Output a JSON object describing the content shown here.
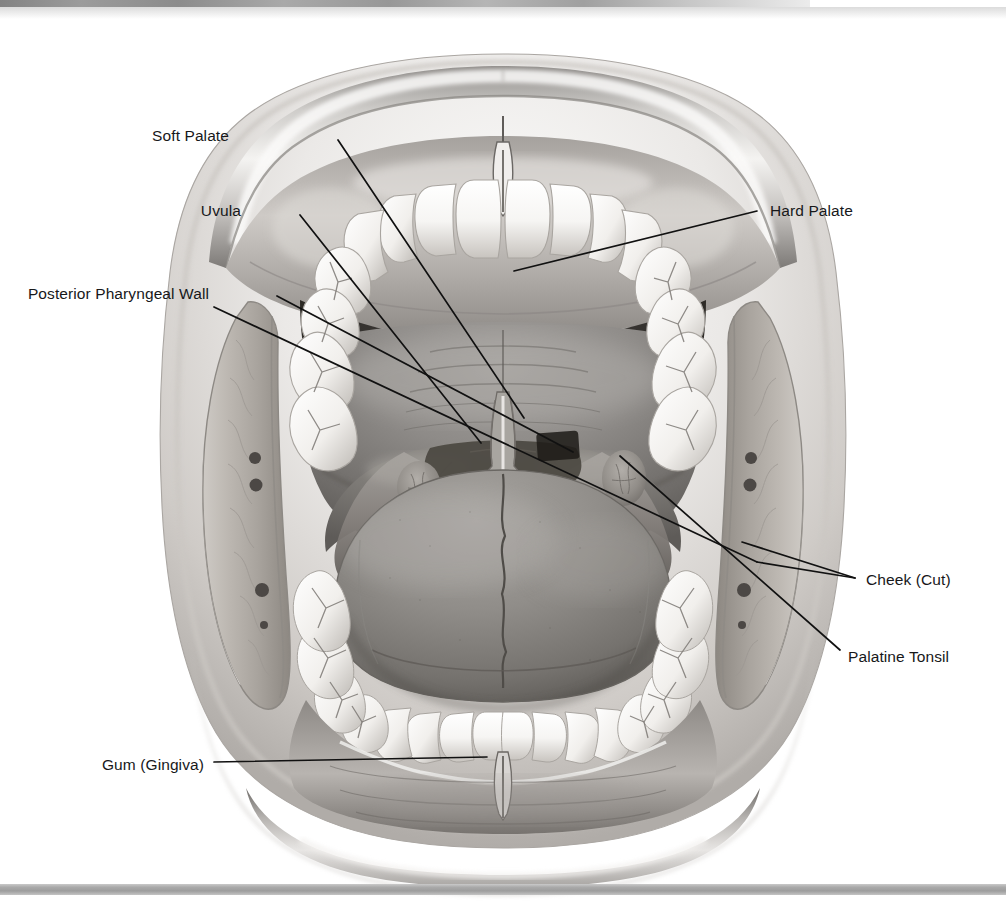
{
  "figure": {
    "style": "grayscale medical illustration, pen-and-ink with airbrush shading"
  },
  "colors": {
    "background": "#ffffff",
    "leader_line": "#111111",
    "label_text": "#17181a",
    "scan_edge_dark": "#6d6d6d",
    "bottom_bar": "#a9a9a9",
    "lip_light": "#f3f1ef",
    "lip_mid": "#b9b6b3",
    "lip_dark": "#6e6b68",
    "palate_mid": "#8d8a88",
    "palate_dark": "#56534f",
    "tooth_light": "#fbfbfa",
    "tooth_shadow": "#a9a6a2",
    "tongue_mid": "#8b8885",
    "tongue_dark": "#5d5a57",
    "pharynx_dark": "#2e2c2a",
    "cheek_tissue": "#b4b0ab",
    "cheek_vessel": "#4c4845"
  },
  "labels": [
    {
      "id": "soft-palate",
      "text": "Soft Palate",
      "align": "right",
      "text_x": 229,
      "text_y": 128,
      "leader": [
        [
          338,
          140
        ],
        [
          524,
          418
        ]
      ]
    },
    {
      "id": "uvula",
      "text": "Uvula",
      "align": "right",
      "text_x": 241,
      "text_y": 203,
      "leader": [
        [
          300,
          215
        ],
        [
          481,
          443
        ]
      ]
    },
    {
      "id": "posterior-pharyngeal-wall",
      "text": "Posterior Pharyngeal Wall",
      "align": "right",
      "text_x": 61,
      "text_y": 286,
      "leader": [
        [
          277,
          296
        ],
        [
          573,
          452
        ]
      ]
    },
    {
      "id": "hard-palate",
      "text": "Hard Palate",
      "align": "left",
      "text_x": 770,
      "text_y": 203,
      "leader": [
        [
          757,
          211
        ],
        [
          514,
          271
        ]
      ]
    },
    {
      "id": "cheek-cut",
      "text": "Cheek (Cut)",
      "align": "left",
      "text_x": 866,
      "text_y": 572,
      "leader": [
        [
          855,
          578
        ],
        [
          742,
          542
        ]
      ],
      "leader2": [
        [
          855,
          578
        ],
        [
          757,
          562
        ]
      ],
      "leader3": [
        [
          757,
          562
        ],
        [
          214,
          307
        ]
      ]
    },
    {
      "id": "palatine-tonsil",
      "text": "Palatine Tonsil",
      "align": "left",
      "text_x": 848,
      "text_y": 649,
      "leader": [
        [
          840,
          650
        ],
        [
          620,
          456
        ]
      ]
    },
    {
      "id": "gum-gingiva",
      "text": "Gum (Gingiva)",
      "align": "right",
      "text_x": 90,
      "text_y": 757,
      "leader": [
        [
          214,
          762
        ],
        [
          487,
          757
        ]
      ]
    }
  ],
  "anatomy_parts": [
    "upper lip",
    "lower lip",
    "upper teeth arch (incisors, canines, premolars, molars)",
    "lower teeth arch (incisors, canines, premolars, molars)",
    "hard palate with transverse palatine rugae",
    "soft palate",
    "uvula",
    "palatoglossal arch",
    "palatopharyngeal arch",
    "palatine tonsils (left and right)",
    "posterior pharyngeal wall",
    "tongue with median sulcus",
    "upper gingiva with labial frenulum",
    "lower gingiva with labial frenulum",
    "cheeks shown in cut cross-section with vessels"
  ]
}
